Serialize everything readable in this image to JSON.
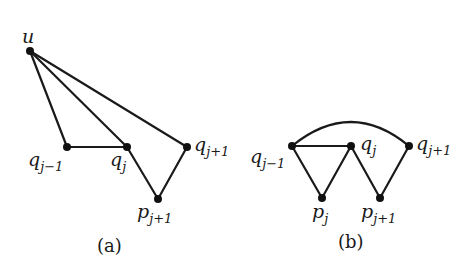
{
  "figure": {
    "panels": [
      {
        "id": "a",
        "caption": "(a)",
        "nodes": [
          {
            "id": "u",
            "label": "u",
            "sub": "",
            "x": 30,
            "y": 51
          },
          {
            "id": "q_jm1",
            "label": "q",
            "sub": "j−1",
            "x": 67,
            "y": 147
          },
          {
            "id": "q_j",
            "label": "q",
            "sub": "j",
            "x": 127,
            "y": 147
          },
          {
            "id": "q_jp1",
            "label": "q",
            "sub": "j+1",
            "x": 187,
            "y": 147
          },
          {
            "id": "p_jp1",
            "label": "p",
            "sub": "j+1",
            "x": 158,
            "y": 199
          }
        ],
        "edges": [
          [
            "u",
            "q_jm1"
          ],
          [
            "u",
            "q_j"
          ],
          [
            "u",
            "q_jp1"
          ],
          [
            "q_jm1",
            "q_j"
          ],
          [
            "q_j",
            "p_jp1"
          ],
          [
            "p_jp1",
            "q_jp1"
          ]
        ]
      },
      {
        "id": "b",
        "caption": "(b)",
        "nodes": [
          {
            "id": "q_jm1",
            "label": "q",
            "sub": "j−1",
            "x": 292,
            "y": 146
          },
          {
            "id": "q_j",
            "label": "q",
            "sub": "j",
            "x": 351,
            "y": 146
          },
          {
            "id": "q_jp1",
            "label": "q",
            "sub": "j+1",
            "x": 409,
            "y": 146
          },
          {
            "id": "p_j",
            "label": "p",
            "sub": "j",
            "x": 322,
            "y": 198
          },
          {
            "id": "p_jp1",
            "label": "p",
            "sub": "j+1",
            "x": 380,
            "y": 198
          }
        ],
        "edges": [
          [
            "q_jm1",
            "q_j"
          ],
          [
            "q_jm1",
            "p_j"
          ],
          [
            "p_j",
            "q_j"
          ],
          [
            "q_j",
            "p_jp1"
          ],
          [
            "p_jp1",
            "q_jp1"
          ]
        ],
        "arcs": [
          {
            "from": "q_jm1",
            "to": "q_jp1",
            "peak_y": 122
          }
        ]
      }
    ]
  }
}
